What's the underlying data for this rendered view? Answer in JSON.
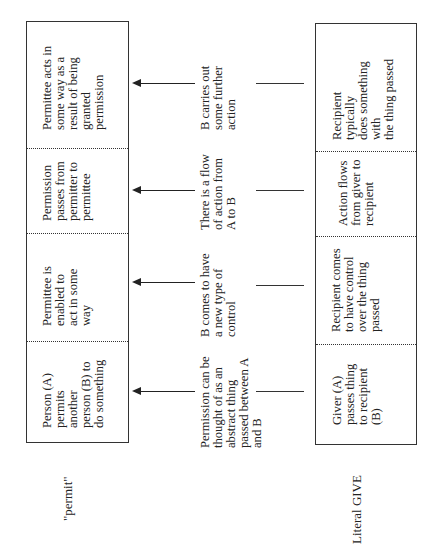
{
  "diagram": {
    "rows": {
      "permit": {
        "label": "\"permit\"",
        "cells": [
          "Person (A)\npermits\nanother\nperson (B) to\ndo something",
          "Permittee is\nenabled to\nact in some\nway",
          "Permission\npasses from\npermitter to\npermittee",
          "Permittee acts in\nsome way as a\nresult of being\ngranted\npermission"
        ]
      },
      "mapping": {
        "cells": [
          "Permission can be\nthought of as an\nabstract thing\npassed between A\nand B",
          "B comes to have\na new type of\ncontrol",
          "There is a flow\nof action from\nA to B",
          "B carries out\nsome further\naction"
        ]
      },
      "literal_give": {
        "label": "Literal GIVE",
        "cells": [
          "Giver (A)\npasses thing\nto recipient\n(B)",
          "Recipient comes\nto have control\nover the thing\npassed",
          "Action flows\nfrom giver to\nrecipient",
          "Recipient typically\ndoes something with\nthe thing passed"
        ]
      }
    },
    "colors": {
      "line": "#333333",
      "text": "#222222",
      "background": "#ffffff"
    }
  }
}
